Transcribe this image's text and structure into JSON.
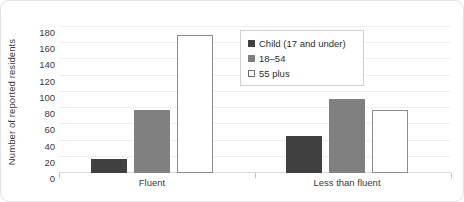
{
  "chart_data": {
    "type": "bar",
    "title": "",
    "subtitle": "",
    "xlabel": "",
    "ylabel": "Number of reported residents",
    "categories": [
      "Fluent",
      "Less than fluent"
    ],
    "series": [
      {
        "name": "Child (17 and under)",
        "values": [
          17,
          46
        ],
        "color": "#404040"
      },
      {
        "name": "18–54",
        "values": [
          78,
          91
        ],
        "color": "#808080"
      },
      {
        "name": "55 plus",
        "values": [
          170,
          78
        ],
        "color": "#ffffff"
      }
    ],
    "ylim": [
      0,
      180
    ],
    "yticks": [
      0,
      20,
      40,
      60,
      80,
      100,
      120,
      140,
      160,
      180
    ],
    "ytick_labels": [
      "0",
      "20",
      "40",
      "60",
      "80",
      "100",
      "120",
      "140",
      "160",
      "180"
    ],
    "grid": true,
    "grid_axis": "y",
    "legend_position": "upper-center",
    "bar_border_color": "#8c8c8c",
    "gridline_color": "#efefef",
    "axis_color": "#d9d9d9",
    "text_color": "#3b3b3b"
  }
}
